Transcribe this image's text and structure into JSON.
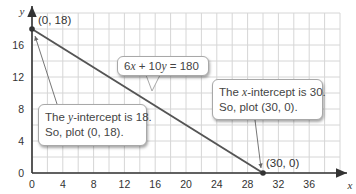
{
  "chart_data": {
    "type": "line",
    "title": "",
    "xlabel": "x",
    "ylabel": "y",
    "xlim": [
      0,
      40
    ],
    "ylim": [
      0,
      20
    ],
    "x_ticks": [
      0,
      4,
      8,
      12,
      16,
      20,
      24,
      28,
      32,
      36
    ],
    "y_ticks": [
      0,
      4,
      8,
      12,
      16
    ],
    "grid": true,
    "grid_step": 2,
    "series": [
      {
        "name": "6x + 10y = 180",
        "x": [
          0,
          30
        ],
        "y": [
          18,
          0
        ],
        "color": "#555555"
      }
    ],
    "points": [
      {
        "label": "(0, 18)",
        "x": 0,
        "y": 18
      },
      {
        "label": "(30, 0)",
        "x": 30,
        "y": 0
      }
    ],
    "annotations": [
      {
        "text": "6x + 10y = 180",
        "target": "line"
      },
      {
        "text": "The y-intercept is 18. So, plot (0, 18).",
        "target": "(0, 18)"
      },
      {
        "text": "The x-intercept is 30. So, plot (30, 0).",
        "target": "(30, 0)"
      }
    ]
  },
  "labels": {
    "axis_x": "x",
    "axis_y": "y",
    "point_y_intercept": "(0, 18)",
    "point_x_intercept": "(30, 0)",
    "equation_parts": {
      "a": "6",
      "v1": "x",
      "mid": " + 10",
      "v2": "y",
      "rhs": " = 180"
    },
    "y_callout": {
      "pre": "The ",
      "var": "y",
      "post": "-intercept is 18.",
      "line2": "So, plot (0, 18)."
    },
    "x_callout": {
      "pre": "The ",
      "var": "x",
      "post": "-intercept is 30.",
      "line2": "So, plot (30, 0)."
    }
  },
  "colors": {
    "grid": "#d6d6d6",
    "axis": "#333333",
    "line": "#555555",
    "point": "#333333"
  }
}
